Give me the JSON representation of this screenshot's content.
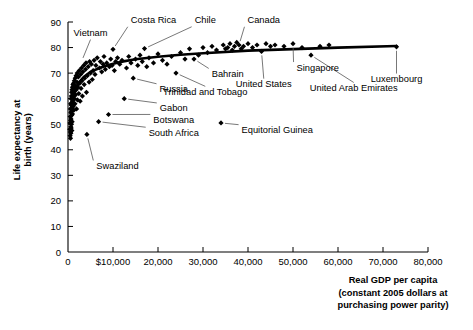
{
  "chart_data": {
    "type": "scatter",
    "title": "",
    "xlabel": "Real GDP per capita (constant 2005 dollars at purchasing power parity)",
    "xlabel_lines": [
      "Real GDP per capita",
      "(constant 2005 dollars at",
      "purchasing power parity)"
    ],
    "ylabel": "Life expectancy at birth (years)",
    "ylabel_lines": [
      "Life expectancy at",
      "birth (years)"
    ],
    "xlim": [
      0,
      80000
    ],
    "ylim": [
      0,
      90
    ],
    "grid": false,
    "legend": "none",
    "xticks": [
      0,
      10000,
      20000,
      30000,
      40000,
      50000,
      60000,
      70000,
      80000
    ],
    "xticklabels": [
      "0",
      "$10,000",
      "20,000",
      "30,000",
      "40,000",
      "50,000",
      "60,000",
      "70,000",
      "80,000"
    ],
    "yticks": [
      0,
      10,
      20,
      30,
      40,
      50,
      60,
      70,
      80,
      90
    ],
    "yticklabels": [
      "0",
      "10",
      "20",
      "30",
      "40",
      "50",
      "60",
      "70",
      "80",
      "90"
    ],
    "marker": "diamond",
    "marker_color": "#000000",
    "trendline": {
      "present": true,
      "color": "#000000",
      "description": "logarithmic fit rising steeply below $10,000 then flattening near 80 years",
      "points": [
        [
          600,
          52.0
        ],
        [
          900,
          57.0
        ],
        [
          1300,
          61.0
        ],
        [
          1800,
          64.0
        ],
        [
          2500,
          66.5
        ],
        [
          3500,
          68.5
        ],
        [
          5000,
          70.5
        ],
        [
          7000,
          72.0
        ],
        [
          9000,
          73.2
        ],
        [
          12000,
          74.5
        ],
        [
          15000,
          75.4
        ],
        [
          20000,
          76.4
        ],
        [
          25000,
          77.2
        ],
        [
          30000,
          77.8
        ],
        [
          40000,
          78.8
        ],
        [
          50000,
          79.4
        ],
        [
          60000,
          80.0
        ],
        [
          73000,
          80.6
        ]
      ]
    },
    "annotations": [
      {
        "label": "Costa Rica",
        "point": [
          10000,
          79.3
        ],
        "text_x": 19000,
        "text_y": 89.5,
        "anchor": "middle"
      },
      {
        "label": "Chile",
        "point": [
          17000,
          79.6
        ],
        "text_x": 30500,
        "text_y": 89.5,
        "anchor": "middle"
      },
      {
        "label": "Canada",
        "point": [
          38000,
          81.0
        ],
        "text_x": 43500,
        "text_y": 89.5,
        "anchor": "middle"
      },
      {
        "label": "Vietnam",
        "point": [
          3000,
          74.5
        ],
        "text_x": 5000,
        "text_y": 84.5,
        "anchor": "middle"
      },
      {
        "label": "Bahrain",
        "point": [
          28000,
          75.5
        ],
        "text_x": 35500,
        "text_y": 68.5,
        "anchor": "middle"
      },
      {
        "label": "Singapore",
        "point": [
          50000,
          81.5
        ],
        "text_x": 55500,
        "text_y": 71.0,
        "anchor": "middle"
      },
      {
        "label": "Luxembourg",
        "point": [
          73000,
          80.3
        ],
        "text_x": 73000,
        "text_y": 66.5,
        "anchor": "middle"
      },
      {
        "label": "United States",
        "point": [
          43000,
          78.5
        ],
        "text_x": 43500,
        "text_y": 64.5,
        "anchor": "middle"
      },
      {
        "label": "United Arab Emirates",
        "point": [
          54000,
          77.0
        ],
        "text_x": 63500,
        "text_y": 63.0,
        "anchor": "middle"
      },
      {
        "label": "Trinidad and Tobago",
        "point": [
          24000,
          70.0
        ],
        "text_x": 30500,
        "text_y": 61.5,
        "anchor": "middle"
      },
      {
        "label": "Russia",
        "point": [
          14500,
          68.0
        ],
        "text_x": 23500,
        "text_y": 62.5,
        "anchor": "middle"
      },
      {
        "label": "Gabon",
        "point": [
          12500,
          60.0
        ],
        "text_x": 23500,
        "text_y": 55.0,
        "anchor": "middle"
      },
      {
        "label": "Botswana",
        "point": [
          9000,
          53.8
        ],
        "text_x": 23500,
        "text_y": 50.5,
        "anchor": "middle"
      },
      {
        "label": "South Africa",
        "point": [
          6800,
          51.0
        ],
        "text_x": 23500,
        "text_y": 45.5,
        "anchor": "middle"
      },
      {
        "label": "Swaziland",
        "point": [
          4200,
          46.0
        ],
        "text_x": 11000,
        "text_y": 32.5,
        "anchor": "middle"
      },
      {
        "label": "Equitorial Guinea",
        "point": [
          34000,
          50.5
        ],
        "text_x": 46500,
        "text_y": 46.5,
        "anchor": "middle"
      }
    ],
    "points": [
      [
        400,
        48.0
      ],
      [
        450,
        50.5
      ],
      [
        480,
        45.5
      ],
      [
        500,
        53.0
      ],
      [
        520,
        47.0
      ],
      [
        540,
        56.0
      ],
      [
        560,
        44.5
      ],
      [
        580,
        51.5
      ],
      [
        600,
        58.0
      ],
      [
        610,
        49.0
      ],
      [
        630,
        54.5
      ],
      [
        650,
        46.5
      ],
      [
        660,
        60.0
      ],
      [
        680,
        52.0
      ],
      [
        700,
        57.5
      ],
      [
        720,
        48.5
      ],
      [
        740,
        61.0
      ],
      [
        760,
        55.0
      ],
      [
        780,
        50.0
      ],
      [
        800,
        62.5
      ],
      [
        820,
        53.5
      ],
      [
        840,
        58.5
      ],
      [
        860,
        47.5
      ],
      [
        880,
        63.5
      ],
      [
        900,
        56.5
      ],
      [
        920,
        51.0
      ],
      [
        950,
        60.5
      ],
      [
        980,
        64.5
      ],
      [
        1000,
        54.0
      ],
      [
        1050,
        59.0
      ],
      [
        1100,
        65.5
      ],
      [
        1150,
        57.0
      ],
      [
        1200,
        62.0
      ],
      [
        1250,
        66.0
      ],
      [
        1300,
        55.5
      ],
      [
        1350,
        63.0
      ],
      [
        1400,
        67.0
      ],
      [
        1450,
        60.0
      ],
      [
        1500,
        64.0
      ],
      [
        1550,
        58.0
      ],
      [
        1600,
        68.0
      ],
      [
        1700,
        61.5
      ],
      [
        1750,
        65.0
      ],
      [
        1800,
        69.0
      ],
      [
        1850,
        63.5
      ],
      [
        1900,
        56.0
      ],
      [
        2000,
        66.5
      ],
      [
        2050,
        70.0
      ],
      [
        2100,
        59.5
      ],
      [
        2200,
        64.5
      ],
      [
        2300,
        68.5
      ],
      [
        2400,
        62.0
      ],
      [
        2500,
        71.0
      ],
      [
        2600,
        66.0
      ],
      [
        2700,
        59.0
      ],
      [
        2800,
        69.5
      ],
      [
        2900,
        64.0
      ],
      [
        3000,
        72.0
      ],
      [
        3100,
        67.0
      ],
      [
        3200,
        61.0
      ],
      [
        3300,
        70.5
      ],
      [
        3500,
        73.0
      ],
      [
        3600,
        65.5
      ],
      [
        3700,
        68.0
      ],
      [
        3900,
        71.5
      ],
      [
        4000,
        74.0
      ],
      [
        4100,
        62.5
      ],
      [
        4200,
        46.0
      ],
      [
        4300,
        69.0
      ],
      [
        4500,
        72.5
      ],
      [
        4700,
        66.5
      ],
      [
        4800,
        74.5
      ],
      [
        5000,
        70.0
      ],
      [
        5200,
        73.5
      ],
      [
        5400,
        67.5
      ],
      [
        5600,
        71.0
      ],
      [
        5800,
        75.0
      ],
      [
        6000,
        69.5
      ],
      [
        6200,
        73.0
      ],
      [
        6500,
        76.0
      ],
      [
        6800,
        51.0
      ],
      [
        7000,
        72.0
      ],
      [
        7200,
        74.5
      ],
      [
        7500,
        70.5
      ],
      [
        7800,
        73.5
      ],
      [
        8000,
        76.5
      ],
      [
        8300,
        71.5
      ],
      [
        8600,
        74.0
      ],
      [
        9000,
        53.8
      ],
      [
        9200,
        72.5
      ],
      [
        9500,
        75.5
      ],
      [
        9800,
        73.0
      ],
      [
        10000,
        79.3
      ],
      [
        10300,
        71.0
      ],
      [
        10600,
        74.5
      ],
      [
        11000,
        76.0
      ],
      [
        11500,
        73.5
      ],
      [
        12000,
        75.0
      ],
      [
        12500,
        60.0
      ],
      [
        13000,
        72.0
      ],
      [
        13500,
        76.5
      ],
      [
        14000,
        74.0
      ],
      [
        14500,
        68.0
      ],
      [
        15000,
        75.5
      ],
      [
        15500,
        73.0
      ],
      [
        16000,
        77.0
      ],
      [
        16500,
        74.5
      ],
      [
        17000,
        79.6
      ],
      [
        17500,
        72.5
      ],
      [
        18000,
        76.0
      ],
      [
        19000,
        74.0
      ],
      [
        20000,
        77.5
      ],
      [
        21000,
        75.0
      ],
      [
        22000,
        73.5
      ],
      [
        23000,
        76.5
      ],
      [
        24000,
        70.0
      ],
      [
        25000,
        78.0
      ],
      [
        26000,
        75.5
      ],
      [
        27000,
        79.5
      ],
      [
        28000,
        75.5
      ],
      [
        29000,
        77.0
      ],
      [
        30000,
        80.0
      ],
      [
        31000,
        78.0
      ],
      [
        32000,
        80.5
      ],
      [
        33000,
        79.0
      ],
      [
        34000,
        50.5
      ],
      [
        34500,
        81.0
      ],
      [
        35000,
        79.5
      ],
      [
        35500,
        80.0
      ],
      [
        36000,
        81.5
      ],
      [
        36500,
        79.0
      ],
      [
        37000,
        80.5
      ],
      [
        37500,
        82.0
      ],
      [
        38000,
        81.0
      ],
      [
        38500,
        79.5
      ],
      [
        39000,
        80.5
      ],
      [
        40000,
        81.5
      ],
      [
        41000,
        80.0
      ],
      [
        42000,
        81.0
      ],
      [
        43000,
        78.5
      ],
      [
        44000,
        81.5
      ],
      [
        45000,
        80.5
      ],
      [
        46000,
        81.0
      ],
      [
        48000,
        80.5
      ],
      [
        50000,
        81.5
      ],
      [
        52000,
        80.0
      ],
      [
        54000,
        77.0
      ],
      [
        56000,
        80.5
      ],
      [
        58000,
        81.0
      ],
      [
        73000,
        80.3
      ]
    ]
  }
}
